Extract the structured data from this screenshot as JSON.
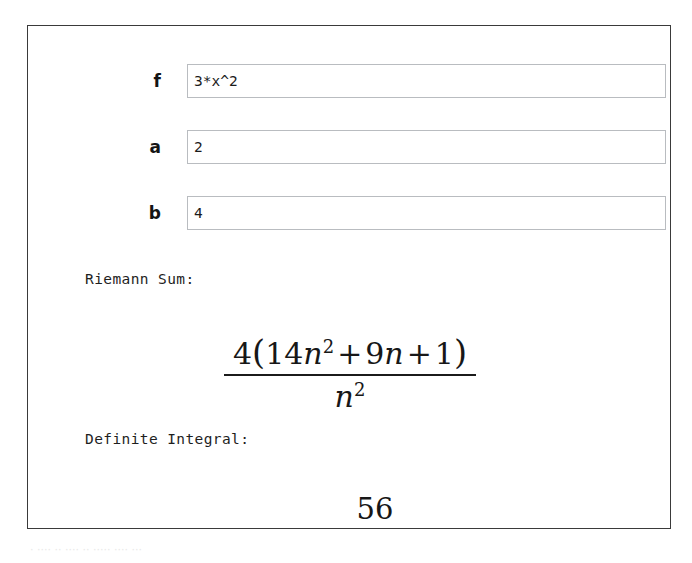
{
  "widget": {
    "fields": [
      {
        "label": "f",
        "value": "3*x^2",
        "placeholder": ""
      },
      {
        "label": "a",
        "value": "2",
        "placeholder": ""
      },
      {
        "label": "b",
        "value": "4",
        "placeholder": ""
      }
    ],
    "riemann": {
      "caption": "Riemann Sum:",
      "expression": "4*(14*n^2 + 9*n + 1)/n^2",
      "numerator": {
        "coefficient": "4",
        "open_paren": "(",
        "term1_coefficient": "14",
        "term1_var": "n",
        "term1_exponent": "2",
        "plus1": "+",
        "term2_coefficient": "9",
        "term2_var": "n",
        "plus2": "+",
        "term3": "1",
        "close_paren": ")"
      },
      "denominator": {
        "var": "n",
        "exponent": "2"
      }
    },
    "integral": {
      "caption": "Definite Integral:",
      "value": "56"
    }
  },
  "artifact": {
    "text": "·  ···· ·· ····  ·· ·····  ···· ···"
  }
}
